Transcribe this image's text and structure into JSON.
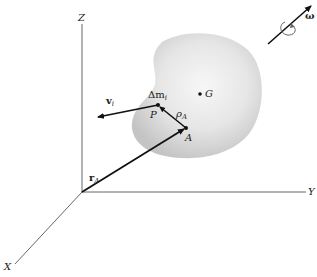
{
  "figure": {
    "axes": {
      "z_label": "Z",
      "y_label": "Y",
      "x_label": "X"
    },
    "body": {
      "center_of_mass_label": "G"
    },
    "points": {
      "particle_label": "P",
      "reference_point_label": "A",
      "mass_element_label": "Δm",
      "mass_element_subscript": "i"
    },
    "vectors": {
      "position_A_label": "r",
      "position_A_subscript": "A",
      "relative_position_label": "ρ",
      "relative_position_subscript": "A",
      "velocity_label": "v",
      "velocity_subscript": "i",
      "angular_velocity_label": "ω"
    },
    "colors": {
      "axis": "#555555",
      "vector": "#111111",
      "body_fill_center": "#f4f4f4",
      "body_fill_edge": "#c8c8c8"
    }
  }
}
